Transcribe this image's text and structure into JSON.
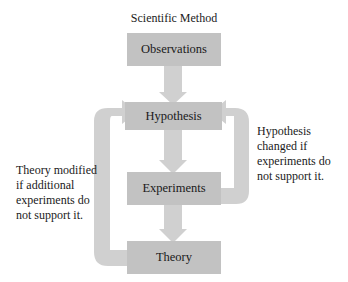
{
  "diagram": {
    "title": "Scientific Method",
    "nodes": [
      {
        "id": "observations",
        "label": "Observations"
      },
      {
        "id": "hypothesis",
        "label": "Hypothesis"
      },
      {
        "id": "experiments",
        "label": "Experiments"
      },
      {
        "id": "theory",
        "label": "Theory"
      }
    ],
    "edges": [
      {
        "from": "observations",
        "to": "hypothesis"
      },
      {
        "from": "hypothesis",
        "to": "experiments"
      },
      {
        "from": "experiments",
        "to": "theory"
      },
      {
        "from": "experiments",
        "to": "hypothesis",
        "note": "right-loop"
      },
      {
        "from": "theory",
        "to": "hypothesis",
        "note": "left-loop"
      }
    ],
    "notes": {
      "right": [
        "Hypothesis",
        "changed if",
        "experiments do",
        "not support it."
      ],
      "left": [
        "Theory modified",
        "if additional",
        "experiments do",
        "not support it."
      ]
    },
    "colors": {
      "box": "#c2c2c2",
      "arrow": "#d0d0d0",
      "text": "#1a1a1a"
    }
  }
}
